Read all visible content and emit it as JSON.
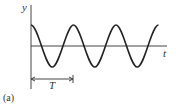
{
  "figure": {
    "panel_label": "(a)",
    "y_axis_label": "y",
    "x_axis_label": "t",
    "period_label": "T"
  },
  "curve": {
    "type": "cosine",
    "cycles_shown": 3.5,
    "stroke_color": "#222222"
  },
  "axes_color": "#444444"
}
